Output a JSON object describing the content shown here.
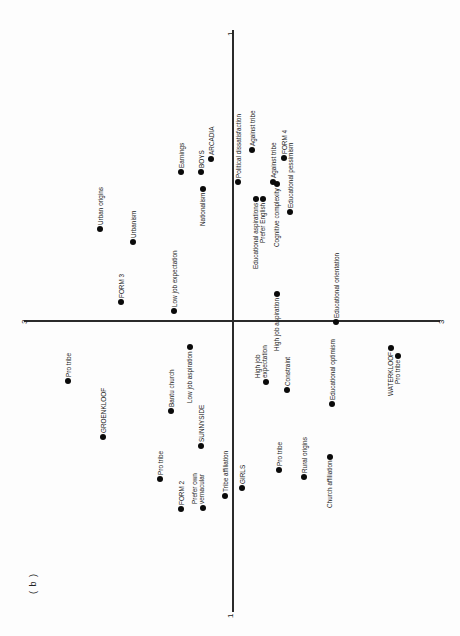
{
  "figure": {
    "panel_label": "( b )",
    "axis_vertical_label_top": "1",
    "axis_vertical_label_bottom": "1",
    "axis_horizontal_label_left": "3",
    "axis_horizontal_label_right": "3"
  },
  "chart_data": {
    "type": "scatter",
    "orientation": "rotated 90° (labels read bottom-to-top)",
    "xlabel": "Dimension 1",
    "ylabel": "Dimension 3",
    "axis_ticks": {
      "dimension_1": [
        "1",
        "1"
      ],
      "dimension_3": [
        "3",
        "3"
      ]
    },
    "grid": false,
    "legend": null,
    "points": [
      {
        "label": "Urban origins",
        "px": 100,
        "py": 229
      },
      {
        "label": "Urbanism",
        "px": 133,
        "py": 242
      },
      {
        "label": "FORM 3",
        "px": 121,
        "py": 302
      },
      {
        "label": "Low job expectation",
        "px": 174,
        "py": 311
      },
      {
        "label": "Earnings",
        "px": 181,
        "py": 172
      },
      {
        "label": "BOYS",
        "px": 201,
        "py": 172
      },
      {
        "label": "ARCADIA",
        "px": 211,
        "py": 159
      },
      {
        "label": "Nationalism",
        "px": 203,
        "py": 189
      },
      {
        "label": "Political dissatisfaction",
        "px": 238,
        "py": 182
      },
      {
        "label": "Against tribe",
        "px": 252,
        "py": 150
      },
      {
        "label": "Against tribe",
        "px": 273,
        "py": 182
      },
      {
        "label": "FORM 4",
        "px": 284,
        "py": 158
      },
      {
        "label": "Educational pessimism",
        "px": 290,
        "py": 212
      },
      {
        "label": "Educational aspirations",
        "px": 256,
        "py": 199
      },
      {
        "label": "Prefer English",
        "px": 263,
        "py": 199
      },
      {
        "label": "Cognitive complexity",
        "px": 277,
        "py": 184
      },
      {
        "label": "High job aspiration",
        "px": 277,
        "py": 294
      },
      {
        "label": "Educational orientation",
        "px": 336,
        "py": 322
      },
      {
        "label": "High job expectation",
        "px": 266,
        "py": 382
      },
      {
        "label": "Constraint",
        "px": 287,
        "py": 390
      },
      {
        "label": "Educational optimism",
        "px": 332,
        "py": 404
      },
      {
        "label": "WATERKLOOF",
        "px": 391,
        "py": 348
      },
      {
        "label": "Pro tribe",
        "px": 398,
        "py": 356
      },
      {
        "label": "Pro tribe",
        "px": 68,
        "py": 381
      },
      {
        "label": "GROENKLOOF",
        "px": 103,
        "py": 437
      },
      {
        "label": "Bantu church",
        "px": 171,
        "py": 411
      },
      {
        "label": "Low job aspiration",
        "px": 190,
        "py": 347
      },
      {
        "label": "SUNNYSIDE",
        "px": 201,
        "py": 446
      },
      {
        "label": "Pro tribe",
        "px": 160,
        "py": 479
      },
      {
        "label": "FORM 2",
        "px": 181,
        "py": 509
      },
      {
        "label": "Prefer own vernacular",
        "px": 203,
        "py": 508
      },
      {
        "label": "Tribe affiliation",
        "px": 225,
        "py": 496
      },
      {
        "label": "GIRLS",
        "px": 242,
        "py": 488
      },
      {
        "label": "Pro tribe",
        "px": 279,
        "py": 470
      },
      {
        "label": "Rural origins",
        "px": 304,
        "py": 477
      },
      {
        "label": "Church affiliation",
        "px": 330,
        "py": 457
      }
    ]
  },
  "points": [
    {
      "label1": "Urban origins",
      "label2": "",
      "x": 100,
      "y": 229,
      "lx": -3,
      "ly": -4,
      "anchor": "above"
    },
    {
      "label1": "Urbanism",
      "label2": "",
      "x": 133,
      "y": 242,
      "lx": -3,
      "ly": -4,
      "anchor": "above"
    },
    {
      "label1": "FORM 3",
      "label2": "",
      "x": 121,
      "y": 302,
      "lx": -3,
      "ly": -4,
      "anchor": "above"
    },
    {
      "label1": "Low job expectation",
      "label2": "",
      "x": 174,
      "y": 311,
      "lx": -3,
      "ly": -4,
      "anchor": "above"
    },
    {
      "label1": "Earnings",
      "label2": "",
      "x": 181,
      "y": 172,
      "lx": -3,
      "ly": -4,
      "anchor": "above"
    },
    {
      "label1": "BOYS",
      "label2": "",
      "x": 201,
      "y": 172,
      "lx": -3,
      "ly": -4,
      "anchor": "above"
    },
    {
      "label1": "ARCADIA",
      "label2": "",
      "x": 211,
      "y": 159,
      "lx": -3,
      "ly": -4,
      "anchor": "above"
    },
    {
      "label1": "Nationalism",
      "label2": "",
      "x": 203,
      "y": 189,
      "lx": -4,
      "ly": 4,
      "anchor": "below"
    },
    {
      "label1": "Political dissatisfaction",
      "label2": "",
      "x": 238,
      "y": 182,
      "lx": -3,
      "ly": -4,
      "anchor": "above"
    },
    {
      "label1": "Against tribe",
      "label2": "",
      "x": 252,
      "y": 150,
      "lx": -3,
      "ly": -4,
      "anchor": "above"
    },
    {
      "label1": "Against tribe",
      "label2": "",
      "x": 273,
      "y": 182,
      "lx": -3,
      "ly": -4,
      "anchor": "above"
    },
    {
      "label1": "FORM 4",
      "label2": "",
      "x": 284,
      "y": 158,
      "lx": -3,
      "ly": -4,
      "anchor": "above"
    },
    {
      "label1": "Educational pessimism",
      "label2": "",
      "x": 290,
      "y": 212,
      "lx": -3,
      "ly": -4,
      "anchor": "above"
    },
    {
      "label1": "Educational aspirations",
      "label2": "",
      "x": 256,
      "y": 199,
      "lx": -4,
      "ly": 4,
      "anchor": "below"
    },
    {
      "label1": "Prefer English",
      "label2": "",
      "x": 263,
      "y": 199,
      "lx": -4,
      "ly": 4,
      "anchor": "below"
    },
    {
      "label1": "Cognitive complexity",
      "label2": "",
      "x": 277,
      "y": 184,
      "lx": -4,
      "ly": 4,
      "anchor": "below"
    },
    {
      "label1": "High job aspiration",
      "label2": "",
      "x": 277,
      "y": 294,
      "lx": -4,
      "ly": 4,
      "anchor": "below"
    },
    {
      "label1": "Educational orientation",
      "label2": "",
      "x": 336,
      "y": 322,
      "lx": -3,
      "ly": -4,
      "anchor": "above"
    },
    {
      "label1": "High job",
      "label2": "expectation",
      "x": 266,
      "y": 382,
      "lx": -8,
      "ly": -4,
      "anchor": "above"
    },
    {
      "label1": "Constraint",
      "label2": "",
      "x": 287,
      "y": 390,
      "lx": -3,
      "ly": -4,
      "anchor": "above"
    },
    {
      "label1": "Educational optimism",
      "label2": "",
      "x": 332,
      "y": 404,
      "lx": -3,
      "ly": -4,
      "anchor": "above"
    },
    {
      "label1": "WATERKLOOF",
      "label2": "",
      "x": 391,
      "y": 348,
      "lx": -4,
      "ly": 4,
      "anchor": "below"
    },
    {
      "label1": "Pro tribe",
      "label2": "",
      "x": 398,
      "y": 356,
      "lx": -4,
      "ly": 4,
      "anchor": "below"
    },
    {
      "label1": "Pro tribe",
      "label2": "",
      "x": 68,
      "y": 381,
      "lx": -3,
      "ly": -4,
      "anchor": "above"
    },
    {
      "label1": "GROENKLOOF",
      "label2": "",
      "x": 103,
      "y": 437,
      "lx": -3,
      "ly": -4,
      "anchor": "above"
    },
    {
      "label1": "Bantu church",
      "label2": "",
      "x": 171,
      "y": 411,
      "lx": -3,
      "ly": -4,
      "anchor": "above"
    },
    {
      "label1": "Low job aspiration",
      "label2": "",
      "x": 190,
      "y": 347,
      "lx": -4,
      "ly": 4,
      "anchor": "below"
    },
    {
      "label1": "SUNNYSIDE",
      "label2": "",
      "x": 201,
      "y": 446,
      "lx": -3,
      "ly": -4,
      "anchor": "above"
    },
    {
      "label1": "Pro tribe",
      "label2": "",
      "x": 160,
      "y": 479,
      "lx": -3,
      "ly": -4,
      "anchor": "above"
    },
    {
      "label1": "FORM 2",
      "label2": "",
      "x": 181,
      "y": 509,
      "lx": -3,
      "ly": -4,
      "anchor": "above"
    },
    {
      "label1": "Prefer own",
      "label2": "vernacular",
      "x": 203,
      "y": 508,
      "lx": -8,
      "ly": -4,
      "anchor": "above"
    },
    {
      "label1": "Tribe affiliation",
      "label2": "",
      "x": 225,
      "y": 496,
      "lx": -3,
      "ly": -4,
      "anchor": "above"
    },
    {
      "label1": "GIRLS",
      "label2": "",
      "x": 242,
      "y": 488,
      "lx": -3,
      "ly": -4,
      "anchor": "above"
    },
    {
      "label1": "Pro tribe",
      "label2": "",
      "x": 279,
      "y": 470,
      "lx": -3,
      "ly": -4,
      "anchor": "above"
    },
    {
      "label1": "Rural origins",
      "label2": "",
      "x": 304,
      "y": 477,
      "lx": -3,
      "ly": -4,
      "anchor": "above"
    },
    {
      "label1": "Church affiliation",
      "label2": "",
      "x": 330,
      "y": 457,
      "lx": -4,
      "ly": 4,
      "anchor": "below"
    }
  ]
}
